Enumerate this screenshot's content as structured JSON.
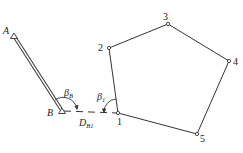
{
  "diagram": {
    "type": "traverse-survey",
    "stroke_color": "#333333",
    "background": "#ffffff",
    "points": {
      "A": {
        "label": "A",
        "x": 14,
        "y": 36
      },
      "B": {
        "label": "B",
        "x": 62,
        "y": 111
      },
      "p1": {
        "label": "1",
        "x": 118,
        "y": 113
      },
      "p2": {
        "label": "2",
        "x": 109,
        "y": 48
      },
      "p3": {
        "label": "3",
        "x": 168,
        "y": 24
      },
      "p4": {
        "label": "4",
        "x": 229,
        "y": 61
      },
      "p5": {
        "label": "5",
        "x": 197,
        "y": 134
      }
    },
    "angles": {
      "beta_B": {
        "symbol": "β",
        "subscript": "B"
      },
      "beta_1": {
        "symbol": "β",
        "subscript": "1"
      }
    },
    "distance": {
      "symbol": "D",
      "subscript": "B1"
    },
    "edges": [
      {
        "from": "A",
        "to": "B",
        "style": "double"
      },
      {
        "from": "B",
        "to": "p1",
        "style": "dashed"
      },
      {
        "from": "p1",
        "to": "p2",
        "style": "solid"
      },
      {
        "from": "p2",
        "to": "p3",
        "style": "solid"
      },
      {
        "from": "p3",
        "to": "p4",
        "style": "solid"
      },
      {
        "from": "p4",
        "to": "p5",
        "style": "solid"
      },
      {
        "from": "p5",
        "to": "p1",
        "style": "solid"
      }
    ]
  }
}
